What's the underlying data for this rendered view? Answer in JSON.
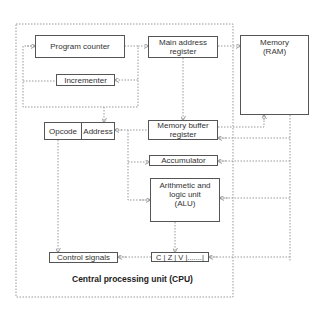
{
  "diagram": {
    "title": "Central processing unit (CPU)",
    "components": {
      "program_counter": "Program counter",
      "incrementer": "Incrementer",
      "main_address_register": "Main address register",
      "memory": "Memory (RAM)",
      "opcode": "Opcode",
      "address": "Address",
      "memory_buffer_register": "Memory buffer register",
      "accumulator": "Accumulator",
      "alu": "Arithmetic and logic unit (ALU)",
      "flags": "C | Z | V |.......|",
      "control_signals": "Control signals"
    },
    "line_style": "dotted",
    "colors": {
      "line": "#888888",
      "box_border": "#555555",
      "text": "#333333"
    }
  }
}
